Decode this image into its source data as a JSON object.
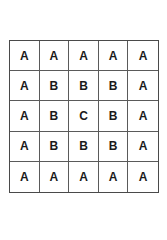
{
  "grid": {
    "rows": 5,
    "cols": 5,
    "cells": [
      [
        "A",
        "A",
        "A",
        "A",
        "A"
      ],
      [
        "A",
        "B",
        "B",
        "B",
        "A"
      ],
      [
        "A",
        "B",
        "C",
        "B",
        "A"
      ],
      [
        "A",
        "B",
        "B",
        "B",
        "A"
      ],
      [
        "A",
        "A",
        "A",
        "A",
        "A"
      ]
    ]
  }
}
